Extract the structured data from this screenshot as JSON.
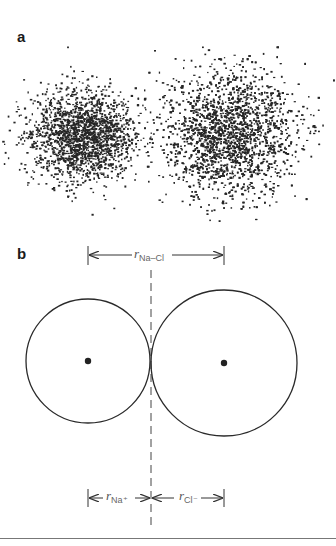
{
  "panels": {
    "a": {
      "label": "a",
      "description": "Electron density dot clouds of two ions"
    },
    "b": {
      "label": "b",
      "description": "Hard-sphere model of Na+ and Cl- ions in contact"
    }
  },
  "ions": [
    {
      "name": "Na+",
      "cloud_center": [
        82,
        135
      ],
      "cloud_radius": 62,
      "circle_center": [
        88,
        361
      ],
      "circle_radius": 62
    },
    {
      "name": "Cl-",
      "cloud_center": [
        228,
        133
      ],
      "cloud_radius": 78,
      "circle_center": [
        224,
        363
      ],
      "circle_radius": 73
    }
  ],
  "dimensions": {
    "total": {
      "symbol": "r",
      "subscript": "Na–Cl"
    },
    "cation": {
      "symbol": "r",
      "subscript": "Na⁺"
    },
    "anion": {
      "symbol": "r",
      "subscript": "Cl⁻"
    }
  },
  "colors": {
    "ink": "#2a2a2a",
    "dots": "#262626",
    "dashed": "#444444",
    "rule": "#777777"
  }
}
